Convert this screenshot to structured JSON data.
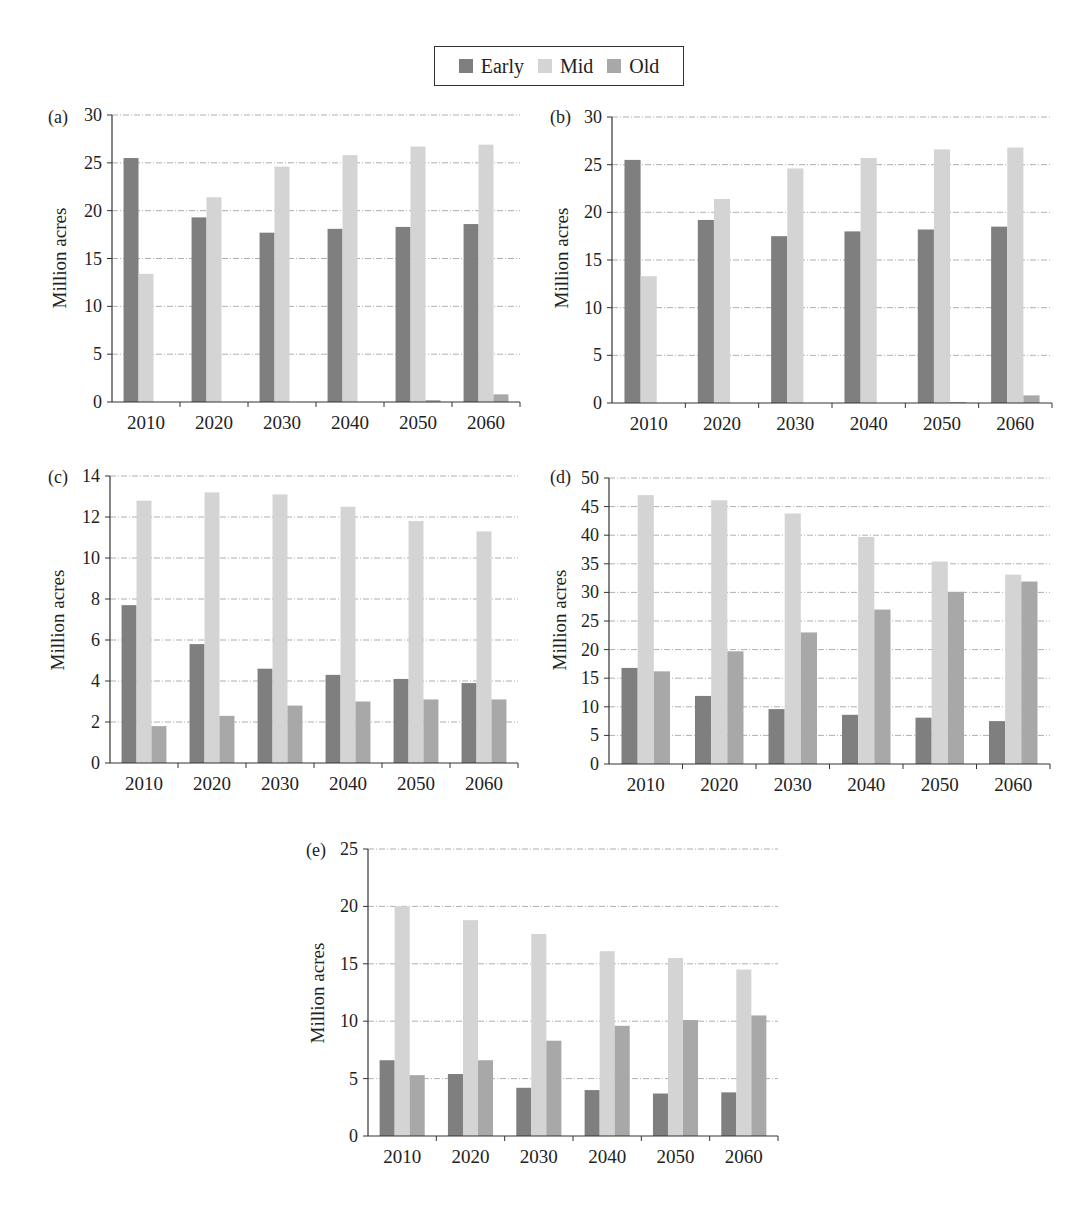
{
  "legend": {
    "items": [
      {
        "label": "Early",
        "color": "#7f7f7f"
      },
      {
        "label": "Mid",
        "color": "#d4d4d4"
      },
      {
        "label": "Old",
        "color": "#a8a8a8"
      }
    ]
  },
  "chart_data": [
    {
      "type": "bar",
      "panel": "(a)",
      "title": "",
      "xlabel": "",
      "ylabel": "Million acres",
      "ylim": [
        0,
        30
      ],
      "yticks": [
        0,
        5,
        10,
        15,
        20,
        25,
        30
      ],
      "grid": true,
      "legend_position": "top-center (shared)",
      "categories": [
        "2010",
        "2020",
        "2030",
        "2040",
        "2050",
        "2060"
      ],
      "series": [
        {
          "name": "Early",
          "values": [
            25.5,
            19.3,
            17.7,
            18.1,
            18.3,
            18.6
          ]
        },
        {
          "name": "Mid",
          "values": [
            13.4,
            21.4,
            24.6,
            25.8,
            26.7,
            26.9
          ]
        },
        {
          "name": "Old",
          "values": [
            0,
            0,
            0,
            0,
            0.2,
            0.8
          ]
        }
      ]
    },
    {
      "type": "bar",
      "panel": "(b)",
      "title": "",
      "xlabel": "",
      "ylabel": "Million acres",
      "ylim": [
        0,
        30
      ],
      "yticks": [
        0,
        5,
        10,
        15,
        20,
        25,
        30
      ],
      "grid": true,
      "legend_position": "top-center (shared)",
      "categories": [
        "2010",
        "2020",
        "2030",
        "2040",
        "2050",
        "2060"
      ],
      "series": [
        {
          "name": "Early",
          "values": [
            25.5,
            19.2,
            17.5,
            18.0,
            18.2,
            18.5
          ]
        },
        {
          "name": "Mid",
          "values": [
            13.3,
            21.4,
            24.6,
            25.7,
            26.6,
            26.8
          ]
        },
        {
          "name": "Old",
          "values": [
            0,
            0,
            0,
            0,
            0.1,
            0.8
          ]
        }
      ]
    },
    {
      "type": "bar",
      "panel": "(c)",
      "title": "",
      "xlabel": "",
      "ylabel": "Million acres",
      "ylim": [
        0,
        14
      ],
      "yticks": [
        0,
        2,
        4,
        6,
        8,
        10,
        12,
        14
      ],
      "grid": true,
      "legend_position": "top-center (shared)",
      "categories": [
        "2010",
        "2020",
        "2030",
        "2040",
        "2050",
        "2060"
      ],
      "series": [
        {
          "name": "Early",
          "values": [
            7.7,
            5.8,
            4.6,
            4.3,
            4.1,
            3.9
          ]
        },
        {
          "name": "Mid",
          "values": [
            12.8,
            13.2,
            13.1,
            12.5,
            11.8,
            11.3
          ]
        },
        {
          "name": "Old",
          "values": [
            1.8,
            2.3,
            2.8,
            3.0,
            3.1,
            3.1
          ]
        }
      ]
    },
    {
      "type": "bar",
      "panel": "(d)",
      "title": "",
      "xlabel": "",
      "ylabel": "Million acres",
      "ylim": [
        0,
        50
      ],
      "yticks": [
        0,
        5,
        10,
        15,
        20,
        25,
        30,
        35,
        40,
        45,
        50
      ],
      "grid": true,
      "legend_position": "top-center (shared)",
      "categories": [
        "2010",
        "2020",
        "2030",
        "2040",
        "2050",
        "2060"
      ],
      "series": [
        {
          "name": "Early",
          "values": [
            16.8,
            11.9,
            9.6,
            8.6,
            8.1,
            7.5
          ]
        },
        {
          "name": "Mid",
          "values": [
            47.0,
            46.1,
            43.8,
            39.7,
            35.4,
            33.1
          ]
        },
        {
          "name": "Old",
          "values": [
            16.2,
            19.7,
            23.0,
            27.0,
            30.1,
            31.9
          ]
        }
      ]
    },
    {
      "type": "bar",
      "panel": "(e)",
      "title": "",
      "xlabel": "",
      "ylabel": "Million acres",
      "ylim": [
        0,
        25
      ],
      "yticks": [
        0,
        5,
        10,
        15,
        20,
        25
      ],
      "grid": true,
      "legend_position": "top-center (shared)",
      "categories": [
        "2010",
        "2020",
        "2030",
        "2040",
        "2050",
        "2060"
      ],
      "series": [
        {
          "name": "Early",
          "values": [
            6.6,
            5.4,
            4.2,
            4.0,
            3.7,
            3.8
          ]
        },
        {
          "name": "Mid",
          "values": [
            20.0,
            18.8,
            17.6,
            16.1,
            15.5,
            14.5
          ]
        },
        {
          "name": "Old",
          "values": [
            5.3,
            6.6,
            8.3,
            9.6,
            10.1,
            10.5
          ]
        }
      ]
    }
  ]
}
